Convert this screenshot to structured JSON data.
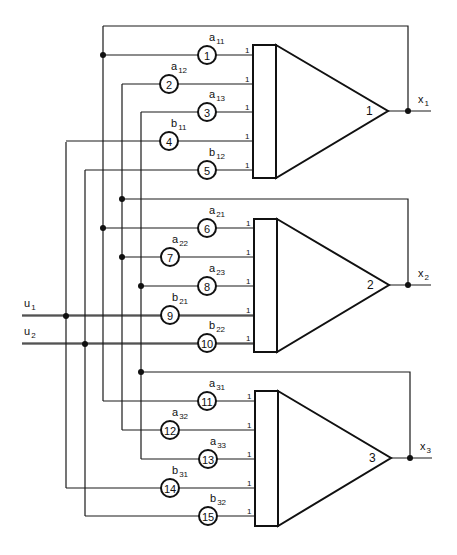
{
  "diagram": {
    "colors": {
      "line": "#111111",
      "background": "#ffffff"
    },
    "inputs": [
      {
        "id": "u1",
        "label": "u",
        "sub": "1",
        "y": 316,
        "x_start": 22,
        "junction_x": 66
      },
      {
        "id": "u2",
        "label": "u",
        "sub": "2",
        "y": 344,
        "x_start": 22,
        "junction_x": 85
      }
    ],
    "buses": [
      {
        "id": "bus-u1",
        "x": 66,
        "y1": 142,
        "y2": 488
      },
      {
        "id": "bus-u2",
        "x": 85,
        "y1": 170,
        "y2": 516
      },
      {
        "id": "bus-x1",
        "x": 103,
        "y1": 26,
        "y2": 401
      },
      {
        "id": "bus-x2",
        "x": 122,
        "y1": 84,
        "y2": 430
      },
      {
        "id": "bus-x3",
        "x": 141,
        "y1": 112,
        "y2": 459
      }
    ],
    "feedback": [
      {
        "id": "fb-x1",
        "bus_x": 103,
        "y_top": 26,
        "right_x": 408,
        "out_y": 111,
        "junction": [
          103,
          55
        ]
      },
      {
        "id": "fb-x2",
        "bus_x": 122,
        "y_top": 199,
        "right_x": 408,
        "out_y": 285,
        "junction": [
          122,
          199
        ]
      },
      {
        "id": "fb-x3",
        "bus_x": 141,
        "y_top": 372,
        "right_x": 410,
        "out_y": 458,
        "junction": [
          141,
          372
        ]
      }
    ],
    "junctions": [
      [
        103,
        55
      ],
      [
        122,
        199
      ],
      [
        103,
        228
      ],
      [
        122,
        257
      ],
      [
        141,
        286
      ],
      [
        66,
        316
      ],
      [
        85,
        344
      ],
      [
        141,
        372
      ]
    ],
    "amplifiers": [
      {
        "number": "1",
        "box": {
          "x": 253,
          "y": 45,
          "w": 23,
          "h": 133
        },
        "tip": [
          388,
          111
        ],
        "output": {
          "dot_x": 408,
          "end_x": 431,
          "label": "x",
          "sub": "1"
        },
        "inputs": [
          {
            "circle": "1",
            "coef": "a",
            "sub": "11",
            "y": 55,
            "cx": 207,
            "from_x": 103
          },
          {
            "circle": "2",
            "coef": "a",
            "sub": "12",
            "y": 84,
            "cx": 169,
            "from_x": 122
          },
          {
            "circle": "3",
            "coef": "a",
            "sub": "13",
            "y": 112,
            "cx": 207,
            "from_x": 141
          },
          {
            "circle": "4",
            "coef": "b",
            "sub": "11",
            "y": 141,
            "cx": 169,
            "from_x": 66
          },
          {
            "circle": "5",
            "coef": "b",
            "sub": "12",
            "y": 170,
            "cx": 207,
            "from_x": 85
          }
        ]
      },
      {
        "number": "2",
        "box": {
          "x": 254,
          "y": 219,
          "w": 23,
          "h": 133
        },
        "tip": [
          389,
          285
        ],
        "output": {
          "dot_x": 408,
          "end_x": 431,
          "label": "x",
          "sub": "2"
        },
        "inputs": [
          {
            "circle": "6",
            "coef": "a",
            "sub": "21",
            "y": 228,
            "cx": 207,
            "from_x": 103
          },
          {
            "circle": "7",
            "coef": "a",
            "sub": "22",
            "y": 257,
            "cx": 170,
            "from_x": 122
          },
          {
            "circle": "8",
            "coef": "a",
            "sub": "23",
            "y": 286,
            "cx": 207,
            "from_x": 141
          },
          {
            "circle": "9",
            "coef": "b",
            "sub": "21",
            "y": 315,
            "cx": 170,
            "from_x": 22
          },
          {
            "circle": "10",
            "coef": "b",
            "sub": "22",
            "y": 343,
            "cx": 207,
            "from_x": 22
          }
        ]
      },
      {
        "number": "3",
        "box": {
          "x": 255,
          "y": 391,
          "w": 23,
          "h": 135
        },
        "tip": [
          391,
          458
        ],
        "output": {
          "dot_x": 410,
          "end_x": 432,
          "label": "x",
          "sub": "3"
        },
        "inputs": [
          {
            "circle": "11",
            "coef": "a",
            "sub": "31",
            "y": 401,
            "cx": 207,
            "from_x": 103
          },
          {
            "circle": "12",
            "coef": "a",
            "sub": "32",
            "y": 430,
            "cx": 170,
            "from_x": 122
          },
          {
            "circle": "13",
            "coef": "a",
            "sub": "33",
            "y": 459,
            "cx": 208,
            "from_x": 141
          },
          {
            "circle": "14",
            "coef": "b",
            "sub": "31",
            "y": 488,
            "cx": 170,
            "from_x": 66
          },
          {
            "circle": "15",
            "coef": "b",
            "sub": "32",
            "y": 516,
            "cx": 208,
            "from_x": 85
          }
        ]
      }
    ],
    "input_gain_label": "1"
  }
}
